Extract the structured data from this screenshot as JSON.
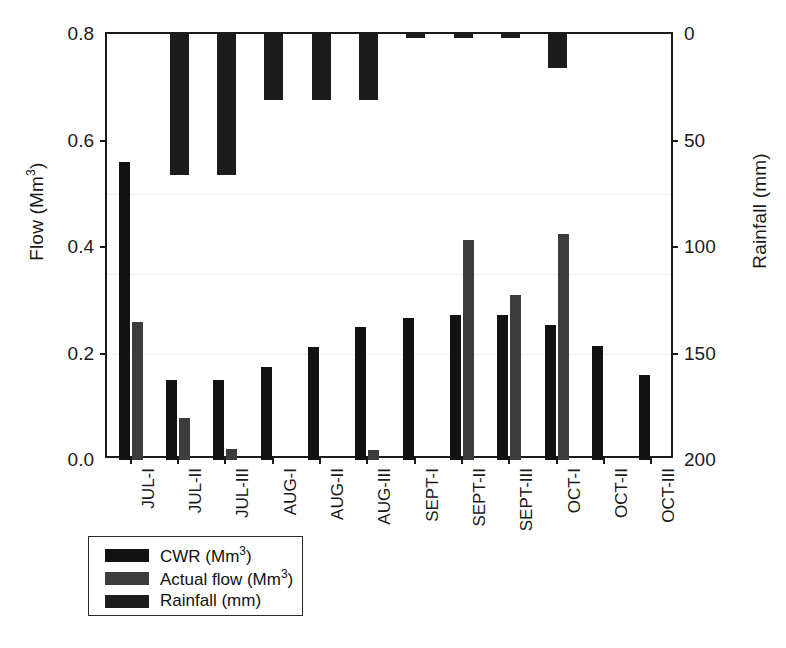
{
  "chart_data": {
    "type": "bar",
    "title": "",
    "subtitle": "",
    "xlabel": "",
    "ylabel": "Flow (Mm3)",
    "ylabel_display": "Flow (Mm",
    "ylabel_sup": "3",
    "ylabel_tail": ")",
    "y2label_display": "Rainfall (mm)",
    "categories": [
      "JUL-I",
      "JUL-II",
      "JUL-III",
      "AUG-I",
      "AUG-II",
      "AUG-III",
      "SEPT-I",
      "SEPT-II",
      "SEPT-III",
      "OCT-I",
      "OCT-II",
      "OCT-III"
    ],
    "series": [
      {
        "name": "CWR (Mm3)",
        "axis": "left",
        "color": "#121212",
        "values": [
          0.56,
          0.15,
          0.15,
          0.175,
          0.212,
          0.25,
          0.266,
          0.272,
          0.272,
          0.253,
          0.215,
          0.16
        ]
      },
      {
        "name": "Actual flow (Mm3)",
        "axis": "left",
        "color": "#3c3c3c",
        "values": [
          0.26,
          0.078,
          0.021,
          0.0,
          0.0,
          0.018,
          0.0,
          0.414,
          0.31,
          0.425,
          0.0,
          0.0
        ]
      },
      {
        "name": "Rainfall (mm)",
        "axis": "right",
        "color": "#1c1c1c",
        "values": [
          0,
          66,
          66,
          31,
          31,
          31,
          2,
          2,
          2,
          16,
          0,
          0
        ]
      }
    ],
    "ylim": [
      0.0,
      0.8
    ],
    "yticks": [
      0.0,
      0.2,
      0.4,
      0.6,
      0.8
    ],
    "ytick_labels": [
      "0.0",
      "0.2",
      "0.4",
      "0.6",
      "0.8"
    ],
    "y2lim": [
      0,
      200
    ],
    "y2_inverted": true,
    "y2ticks": [
      0,
      50,
      100,
      150,
      200
    ],
    "y2tick_labels": [
      "0",
      "50",
      "100",
      "150",
      "200"
    ],
    "grid": false,
    "legend_position": "below-left"
  },
  "legend": {
    "items": [
      {
        "label_main": "CWR (Mm",
        "sup": "3",
        "tail": ")",
        "color": "#121212"
      },
      {
        "label_main": "Actual flow (Mm",
        "sup": "3",
        "tail": ")",
        "color": "#3c3c3c"
      },
      {
        "label_main": "Rainfall (mm)",
        "sup": "",
        "tail": "",
        "color": "#1c1c1c"
      }
    ]
  }
}
